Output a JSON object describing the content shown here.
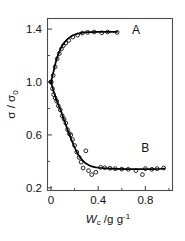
{
  "figure": {
    "background": "#ffffff",
    "axis_color": "#4d4d4d",
    "curve_color": "#000000",
    "marker_color": "#000000"
  },
  "chart_data": {
    "type": "scatter",
    "title": "",
    "xlabel": "Wc /g g-1",
    "xlabel_parts": {
      "symbol": "W",
      "subscript": "c",
      "rest": " /g g",
      "superscript": "-1"
    },
    "ylabel": "σ / σ0",
    "ylabel_parts": {
      "symbol": "σ",
      "sep": " / ",
      "symbol2": "σ",
      "subscript": "0"
    },
    "xlim": [
      -0.03,
      1.03
    ],
    "ylim": [
      0.18,
      1.48
    ],
    "xticks": [
      0,
      0.4,
      0.8
    ],
    "xticklabels": [
      "0",
      "0.4",
      "0.8"
    ],
    "xminorticks": [
      0.2,
      0.6,
      1.0
    ],
    "yticks": [
      0.2,
      0.6,
      1.0,
      1.4
    ],
    "yticklabels": [
      "0.2",
      "0.6",
      "1.0",
      "1.4"
    ],
    "yminorticks": [
      0.4,
      0.8,
      1.2
    ],
    "grid": false,
    "legend": "none",
    "annotations": [
      {
        "text": "A",
        "x": 0.72,
        "y": 1.36
      },
      {
        "text": "B",
        "x": 0.8,
        "y": 0.47
      }
    ],
    "series": [
      {
        "name": "A",
        "label": "A",
        "marker": "open-circle",
        "line": "fitted-curve",
        "points": [
          {
            "x": 0.0,
            "y": 1.0
          },
          {
            "x": 0.018,
            "y": 1.05
          },
          {
            "x": 0.035,
            "y": 1.115
          },
          {
            "x": 0.052,
            "y": 1.175
          },
          {
            "x": 0.07,
            "y": 1.215
          },
          {
            "x": 0.088,
            "y": 1.25
          },
          {
            "x": 0.105,
            "y": 1.275
          },
          {
            "x": 0.125,
            "y": 1.295
          },
          {
            "x": 0.15,
            "y": 1.315
          },
          {
            "x": 0.185,
            "y": 1.34
          },
          {
            "x": 0.225,
            "y": 1.355
          },
          {
            "x": 0.265,
            "y": 1.37
          },
          {
            "x": 0.31,
            "y": 1.375
          },
          {
            "x": 0.365,
            "y": 1.378
          },
          {
            "x": 0.43,
            "y": 1.372
          },
          {
            "x": 0.48,
            "y": 1.378
          },
          {
            "x": 0.56,
            "y": 1.375
          }
        ],
        "curve": [
          {
            "x": 0.0,
            "y": 1.0
          },
          {
            "x": 0.02,
            "y": 1.075
          },
          {
            "x": 0.04,
            "y": 1.15
          },
          {
            "x": 0.06,
            "y": 1.205
          },
          {
            "x": 0.085,
            "y": 1.258
          },
          {
            "x": 0.11,
            "y": 1.295
          },
          {
            "x": 0.14,
            "y": 1.325
          },
          {
            "x": 0.175,
            "y": 1.348
          },
          {
            "x": 0.215,
            "y": 1.363
          },
          {
            "x": 0.26,
            "y": 1.372
          },
          {
            "x": 0.32,
            "y": 1.377
          },
          {
            "x": 0.4,
            "y": 1.379
          },
          {
            "x": 0.48,
            "y": 1.379
          },
          {
            "x": 0.56,
            "y": 1.379
          }
        ]
      },
      {
        "name": "B",
        "label": "B",
        "marker": "open-circle",
        "line": "fitted-curve",
        "points": [
          {
            "x": 0.0,
            "y": 1.0
          },
          {
            "x": 0.012,
            "y": 0.95
          },
          {
            "x": 0.022,
            "y": 0.905
          },
          {
            "x": 0.035,
            "y": 0.88
          },
          {
            "x": 0.048,
            "y": 0.855
          },
          {
            "x": 0.062,
            "y": 0.82
          },
          {
            "x": 0.078,
            "y": 0.79
          },
          {
            "x": 0.095,
            "y": 0.745
          },
          {
            "x": 0.11,
            "y": 0.72
          },
          {
            "x": 0.125,
            "y": 0.69
          },
          {
            "x": 0.14,
            "y": 0.64
          },
          {
            "x": 0.155,
            "y": 0.61
          },
          {
            "x": 0.168,
            "y": 0.6
          },
          {
            "x": 0.182,
            "y": 0.565
          },
          {
            "x": 0.2,
            "y": 0.52
          },
          {
            "x": 0.218,
            "y": 0.47
          },
          {
            "x": 0.238,
            "y": 0.43
          },
          {
            "x": 0.255,
            "y": 0.395
          },
          {
            "x": 0.272,
            "y": 0.35
          },
          {
            "x": 0.295,
            "y": 0.48
          },
          {
            "x": 0.318,
            "y": 0.33
          },
          {
            "x": 0.345,
            "y": 0.3
          },
          {
            "x": 0.38,
            "y": 0.318
          },
          {
            "x": 0.42,
            "y": 0.355
          },
          {
            "x": 0.455,
            "y": 0.352
          },
          {
            "x": 0.5,
            "y": 0.348
          },
          {
            "x": 0.545,
            "y": 0.345
          },
          {
            "x": 0.6,
            "y": 0.342
          },
          {
            "x": 0.655,
            "y": 0.34
          },
          {
            "x": 0.72,
            "y": 0.33
          },
          {
            "x": 0.775,
            "y": 0.3
          },
          {
            "x": 0.8,
            "y": 0.345
          },
          {
            "x": 0.855,
            "y": 0.34
          },
          {
            "x": 0.9,
            "y": 0.345
          },
          {
            "x": 0.955,
            "y": 0.35
          }
        ],
        "curve": [
          {
            "x": 0.0,
            "y": 1.0
          },
          {
            "x": 0.025,
            "y": 0.92
          },
          {
            "x": 0.05,
            "y": 0.855
          },
          {
            "x": 0.08,
            "y": 0.79
          },
          {
            "x": 0.11,
            "y": 0.715
          },
          {
            "x": 0.14,
            "y": 0.64
          },
          {
            "x": 0.17,
            "y": 0.57
          },
          {
            "x": 0.2,
            "y": 0.505
          },
          {
            "x": 0.23,
            "y": 0.452
          },
          {
            "x": 0.265,
            "y": 0.41
          },
          {
            "x": 0.3,
            "y": 0.382
          },
          {
            "x": 0.345,
            "y": 0.362
          },
          {
            "x": 0.4,
            "y": 0.352
          },
          {
            "x": 0.47,
            "y": 0.347
          },
          {
            "x": 0.55,
            "y": 0.344
          },
          {
            "x": 0.65,
            "y": 0.342
          },
          {
            "x": 0.76,
            "y": 0.341
          },
          {
            "x": 0.87,
            "y": 0.342
          },
          {
            "x": 0.96,
            "y": 0.345
          }
        ]
      }
    ]
  }
}
